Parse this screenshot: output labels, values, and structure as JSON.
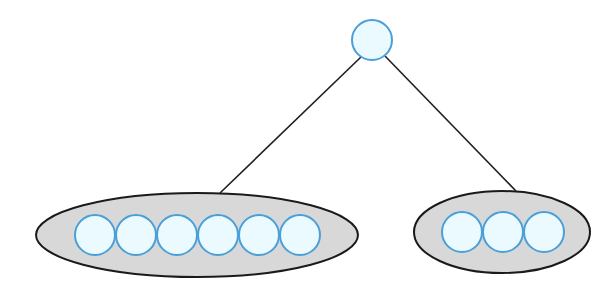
{
  "diagram": {
    "type": "tree",
    "colors": {
      "background": "#ffffff",
      "node_fill": "#eafaff",
      "node_stroke": "#4a9fd8",
      "group_fill": "#d8d8d8",
      "group_stroke": "#1a1a1a",
      "edge": "#1f1f1f"
    },
    "root": {
      "cx": 372,
      "cy": 40,
      "r": 20
    },
    "edges": [
      {
        "x1": 361,
        "y1": 57,
        "x2": 220,
        "y2": 193
      },
      {
        "x1": 385,
        "y1": 56,
        "x2": 516,
        "y2": 191
      }
    ],
    "groups": [
      {
        "name": "left-group",
        "ellipse": {
          "cx": 197,
          "cy": 235,
          "rx": 161,
          "ry": 42
        },
        "node_count": 6,
        "nodes": [
          {
            "cx": 95,
            "cy": 235,
            "r": 20
          },
          {
            "cx": 136,
            "cy": 235,
            "r": 20
          },
          {
            "cx": 177,
            "cy": 235,
            "r": 20
          },
          {
            "cx": 218,
            "cy": 235,
            "r": 20
          },
          {
            "cx": 259,
            "cy": 235,
            "r": 20
          },
          {
            "cx": 300,
            "cy": 235,
            "r": 20
          }
        ]
      },
      {
        "name": "right-group",
        "ellipse": {
          "cx": 502,
          "cy": 232,
          "rx": 88,
          "ry": 41
        },
        "node_count": 3,
        "nodes": [
          {
            "cx": 462,
            "cy": 232,
            "r": 20
          },
          {
            "cx": 503,
            "cy": 232,
            "r": 20
          },
          {
            "cx": 544,
            "cy": 232,
            "r": 20
          }
        ]
      }
    ]
  }
}
